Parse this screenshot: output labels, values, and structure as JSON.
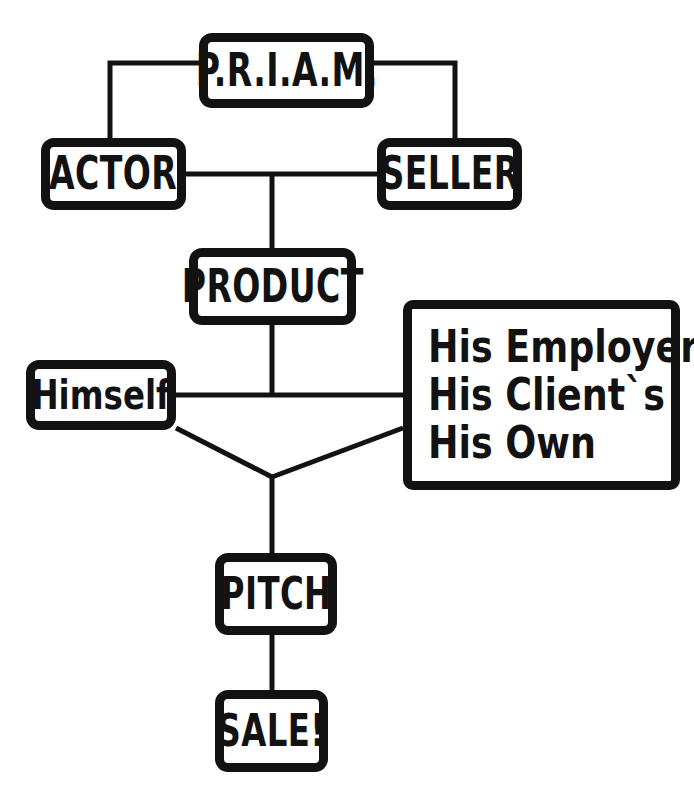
{
  "diagram": {
    "style": {
      "ink": "#121212",
      "paper": "#ffffff",
      "line_width": 5
    },
    "nodes": [
      {
        "id": "priam",
        "label": "P.R.I.A.M.",
        "icon": "rounded-box"
      },
      {
        "id": "actor",
        "label": "ACTOR",
        "icon": "rounded-box"
      },
      {
        "id": "seller",
        "label": "SELLER",
        "icon": "rounded-box"
      },
      {
        "id": "product",
        "label": "PRODUCT",
        "icon": "rounded-box"
      },
      {
        "id": "himself",
        "label": "Himself",
        "icon": "rounded-box"
      },
      {
        "id": "options",
        "label": "His Employer`s / His Client`s / His Own",
        "icon": "rounded-box",
        "lines": [
          "His Employer`s",
          "His Client`s",
          "His Own"
        ]
      },
      {
        "id": "pitch",
        "label": "PITCH",
        "icon": "rounded-box"
      },
      {
        "id": "sale",
        "label": "SALE!",
        "icon": "rounded-box"
      }
    ],
    "options_lines": {
      "line1": "His Employer`s",
      "line2": "His Client`s",
      "line3": "His Own"
    },
    "edges": [
      {
        "from": "priam",
        "to": "actor",
        "kind": "elbow"
      },
      {
        "from": "priam",
        "to": "seller",
        "kind": "elbow"
      },
      {
        "from": "actor",
        "to": "seller",
        "kind": "horizontal"
      },
      {
        "from": "actor-seller-midpoint",
        "to": "product",
        "kind": "vertical"
      },
      {
        "from": "product",
        "to": "junction-bar",
        "kind": "vertical"
      },
      {
        "from": "himself",
        "to": "junction-bar",
        "kind": "horizontal"
      },
      {
        "from": "options",
        "to": "junction-bar",
        "kind": "horizontal"
      },
      {
        "from": "himself",
        "to": "vertex",
        "kind": "diagonal"
      },
      {
        "from": "options",
        "to": "vertex",
        "kind": "diagonal"
      },
      {
        "from": "vertex",
        "to": "pitch",
        "kind": "vertical"
      },
      {
        "from": "pitch",
        "to": "sale",
        "kind": "vertical"
      }
    ]
  }
}
